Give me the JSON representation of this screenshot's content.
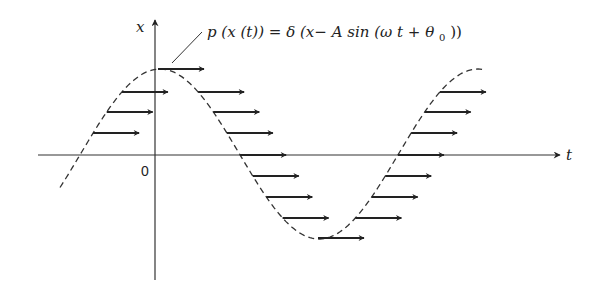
{
  "figure": {
    "axes": {
      "x_axis_label": "t",
      "y_axis_label": "x",
      "origin_label": "0"
    },
    "equation": {
      "lhs": "p (x (t))",
      "eq": "=",
      "rhs_delta": "δ",
      "rhs_body_pre": " (x− A sin (ω t + θ",
      "rhs_sub": "0",
      "rhs_close": "))"
    },
    "curve": {
      "style": "dashed",
      "description": "x = A sin(ωt + θ0)",
      "amplitude_px": 84,
      "period_px": 318
    },
    "colors": {
      "ink": "#222222",
      "background": "#ffffff"
    }
  }
}
